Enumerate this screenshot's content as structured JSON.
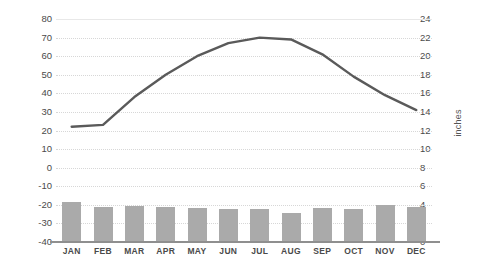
{
  "chart_data": {
    "type": "line",
    "title": "",
    "xlabel": "",
    "ylabel": "°F",
    "y2label": "inches",
    "grid": true,
    "legend": "none",
    "categories": [
      "JAN",
      "FEB",
      "MAR",
      "APR",
      "MAY",
      "JUN",
      "JUL",
      "AUG",
      "SEP",
      "OCT",
      "NOV",
      "DEC"
    ],
    "ylim": [
      -40,
      80
    ],
    "ytick_step": 10,
    "yticks": [
      80,
      70,
      60,
      50,
      40,
      30,
      20,
      10,
      0,
      -10,
      -20,
      -30,
      -40
    ],
    "y2lim": [
      0,
      24
    ],
    "y2tick_step": 2,
    "y2ticks": [
      24,
      22,
      20,
      18,
      16,
      14,
      12,
      10,
      8,
      6,
      4,
      2,
      0
    ],
    "series": [
      {
        "name": "Temperature",
        "type": "line",
        "axis": "left",
        "unit": "°F",
        "color": "#5a5a5a",
        "values": [
          22,
          23,
          38,
          50,
          60,
          67,
          70,
          69,
          61,
          49,
          39,
          31
        ]
      },
      {
        "name": "Precipitation",
        "type": "bar",
        "axis": "right",
        "unit": "inches",
        "color": "#aaaaaa",
        "values": [
          4.3,
          3.8,
          3.9,
          3.8,
          3.7,
          3.6,
          3.5,
          3.1,
          3.7,
          3.6,
          4.0,
          3.8
        ]
      }
    ]
  },
  "colors": {
    "line": "#5a5a5a",
    "bar": "#aaaaaa",
    "grid": "#d7d7d7",
    "axis": "#8f8f8f",
    "text": "#4a4a4a",
    "background": "#ffffff"
  }
}
